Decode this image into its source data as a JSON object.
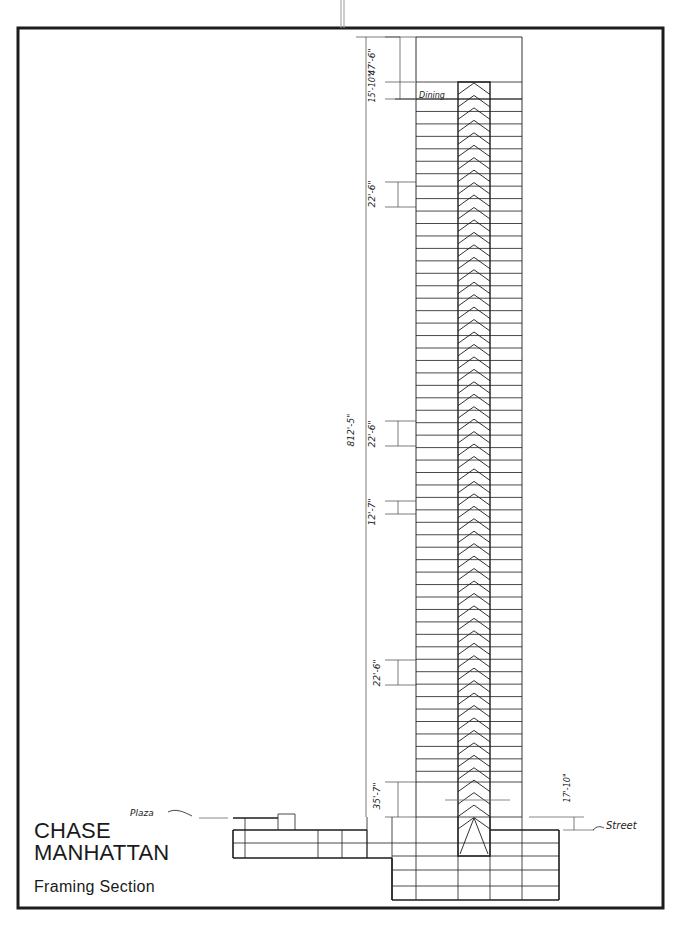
{
  "title_block": {
    "line1": "CHASE",
    "line2": "MANHATTAN",
    "subtitle": "Framing Section"
  },
  "labels": {
    "dining": "Dining",
    "plaza": "Plaza",
    "street": "Street"
  },
  "dimensions": {
    "overall_height": "812'-5\"",
    "top_mech": "47'-6\"",
    "dining_floor": "15'-10\"",
    "mech_upper": "22'-6\"",
    "mech_middle": "22'-6\"",
    "typical_floor": "12'-7\"",
    "mech_lower": "22'-6\"",
    "lobby": "35'-7\"",
    "street_to_plaza": "17'-10\""
  },
  "colors": {
    "ink": "#1c1c1c",
    "light_ink": "#6a6a6a",
    "paper": "#ffffff"
  }
}
